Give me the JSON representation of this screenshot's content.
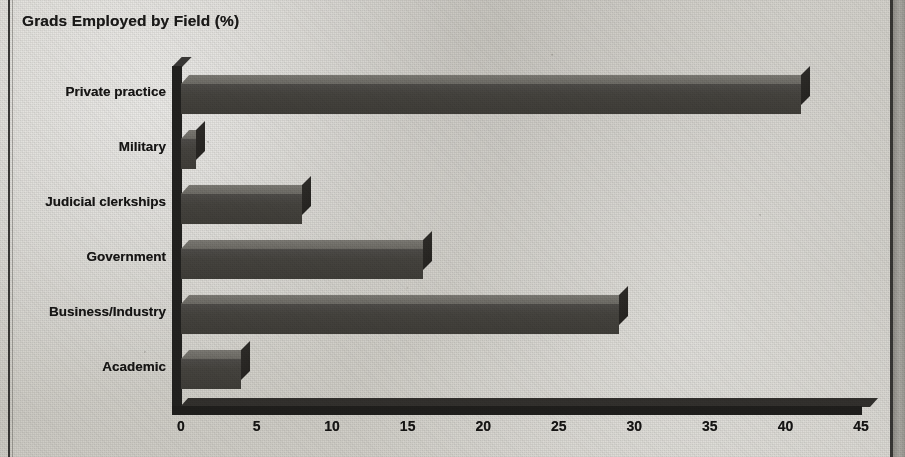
{
  "chart_data": {
    "type": "bar",
    "orientation": "horizontal",
    "title": "Grads Employed by Field (%)",
    "xlabel": "",
    "ylabel": "",
    "xlim": [
      0,
      45
    ],
    "xticks": [
      0,
      5,
      10,
      15,
      20,
      25,
      30,
      35,
      40,
      45
    ],
    "xtick_labels": [
      "0",
      "5",
      "10",
      "15",
      "20",
      "25",
      "30",
      "35",
      "40",
      "45"
    ],
    "grid": false,
    "legend": "none",
    "style": "3d-newsprint",
    "categories": [
      "Private practice",
      "Military",
      "Judicial clerkships",
      "Government",
      "Business/Industry",
      "Academic"
    ],
    "values": [
      41,
      1,
      8,
      16,
      29,
      4
    ],
    "series": [
      {
        "name": "Grads Employed by Field (%)",
        "values": [
          41,
          1,
          8,
          16,
          29,
          4
        ]
      }
    ]
  },
  "colors": {
    "paper": "#d4d2cc",
    "ink": "#1b1a19",
    "bar_front": "#46443f",
    "bar_top": "#73716b",
    "bar_side": "#2b2926",
    "axis": "#232220",
    "rule": "#2b2a28"
  }
}
